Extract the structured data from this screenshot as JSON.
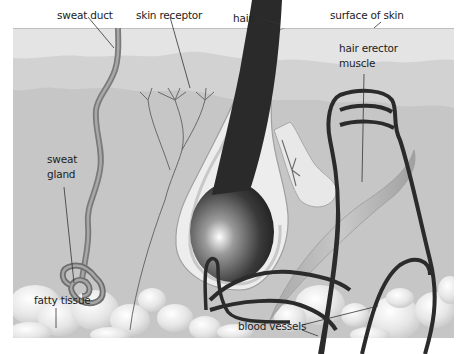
{
  "labels": {
    "sweat_duct": "sweat duct",
    "skin_receptor": "skin receptor",
    "hair": "hair",
    "surface_of_skin": "surface of skin",
    "hair_erector_muscle_line1": "hair erector",
    "hair_erector_muscle_line2": "muscle",
    "sweat_gland_line1": "sweat",
    "sweat_gland_line2": "gland",
    "fatty_tissue": "fatty tissue",
    "blood_vessels": "blood vessels"
  },
  "colors": {
    "epidermis": "#e2e2e2",
    "dermis_upper": "#d0d0d0",
    "dermis": "#c4c4c4",
    "surface_line": "#9a9a9a",
    "hair": "#2a2a2a",
    "vessel": "#2b2b2b",
    "duct": "#8a8a8a",
    "fat": "#eeeeee"
  }
}
